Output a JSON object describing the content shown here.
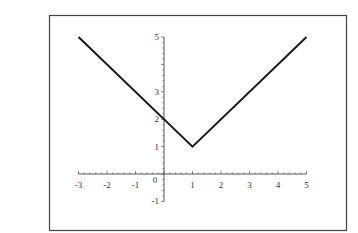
{
  "chart_data": {
    "type": "line",
    "title": "",
    "xlabel": "",
    "ylabel": "",
    "function": "y = |x - 1| + 1",
    "xlim": [
      -3,
      5
    ],
    "ylim": [
      -1,
      5
    ],
    "grid": false,
    "legend": null,
    "x_ticks": [
      -3,
      -2,
      -1,
      0,
      1,
      2,
      3,
      4,
      5
    ],
    "x_tick_labels": [
      "-3",
      "-2",
      "-1",
      "0",
      "1",
      "2",
      "3",
      "4",
      "5"
    ],
    "y_ticks": [
      -1,
      1,
      2,
      3,
      5
    ],
    "y_tick_labels": [
      "-1",
      "1",
      "2",
      "3",
      "5"
    ],
    "series": [
      {
        "name": "y = |x-1|+1",
        "x": [
          -3,
          1,
          5
        ],
        "y": [
          5,
          1,
          5
        ]
      }
    ],
    "colors": {
      "line": "#1a1a1a",
      "axis": "#555555",
      "frame": "#444444"
    }
  }
}
